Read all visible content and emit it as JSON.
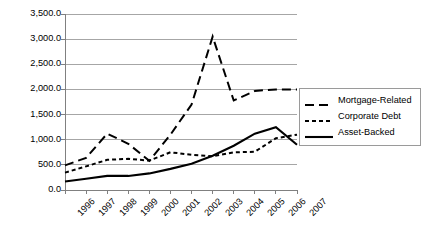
{
  "chart_data": {
    "type": "line",
    "title": "",
    "subtitle": "",
    "xlabel": "",
    "ylabel": "",
    "categories": [
      "1996",
      "1997",
      "1998",
      "1999",
      "2000",
      "2001",
      "2002",
      "2003",
      "2004",
      "2005",
      "2006",
      "2007"
    ],
    "x": [
      1996,
      1997,
      1998,
      1999,
      2000,
      2001,
      2002,
      2003,
      2004,
      2005,
      2006,
      2007
    ],
    "ylim": [
      0,
      3500
    ],
    "xlim": [
      1996,
      2007
    ],
    "grid": true,
    "grid_axis": "y",
    "legend_position": "right",
    "yticks": [
      0,
      500,
      1000,
      1500,
      2000,
      2500,
      3000,
      3500
    ],
    "ytick_labels": [
      "0.0",
      "500.0",
      "1,000.0",
      "1,500.0",
      "2,000.0",
      "2,500.0",
      "3,000.0",
      "3,500.0"
    ],
    "series": [
      {
        "name": "Mortgage-Related",
        "style": "long-dash",
        "color": "#000000",
        "values": [
          490,
          640,
          1120,
          920,
          580,
          1100,
          1700,
          3050,
          1780,
          1970,
          2000,
          2000
        ]
      },
      {
        "name": "Corporate Debt",
        "style": "short-dash",
        "color": "#000000",
        "values": [
          345,
          470,
          600,
          620,
          585,
          750,
          700,
          670,
          750,
          760,
          1030,
          1100
        ]
      },
      {
        "name": "Asset-Backed",
        "style": "solid",
        "color": "#000000",
        "values": [
          170,
          225,
          280,
          280,
          330,
          420,
          520,
          680,
          880,
          1120,
          1250,
          900
        ]
      }
    ]
  },
  "legend": {
    "items": [
      {
        "label": "Mortgage-Related",
        "style": "long-dash"
      },
      {
        "label": "Corporate Debt",
        "style": "short-dash"
      },
      {
        "label": "Asset-Backed",
        "style": "solid"
      }
    ]
  },
  "colors": {
    "ink": "#000000",
    "gridline": "#a6a6a6",
    "axis": "#808080",
    "legend_border": "#9a9a9a",
    "background": "#ffffff"
  }
}
